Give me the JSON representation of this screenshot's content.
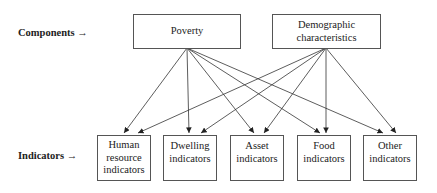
{
  "row_labels": {
    "components": "Components →",
    "indicators": "Indicators →"
  },
  "components": [
    {
      "id": "poverty",
      "label": "Poverty"
    },
    {
      "id": "demographic",
      "label": "Demographic\ncharacteristics"
    }
  ],
  "indicators": [
    {
      "id": "human",
      "label": "Human\nresource\nindicators"
    },
    {
      "id": "dwelling",
      "label": "Dwelling\nindicators"
    },
    {
      "id": "asset",
      "label": "Asset\nindicators"
    },
    {
      "id": "food",
      "label": "Food\nindicators"
    },
    {
      "id": "other",
      "label": "Other\nindicators"
    }
  ],
  "edges": [
    [
      "poverty",
      "human"
    ],
    [
      "poverty",
      "dwelling"
    ],
    [
      "poverty",
      "asset"
    ],
    [
      "poverty",
      "food"
    ],
    [
      "poverty",
      "other"
    ],
    [
      "demographic",
      "human"
    ],
    [
      "demographic",
      "dwelling"
    ],
    [
      "demographic",
      "asset"
    ],
    [
      "demographic",
      "food"
    ],
    [
      "demographic",
      "other"
    ]
  ]
}
